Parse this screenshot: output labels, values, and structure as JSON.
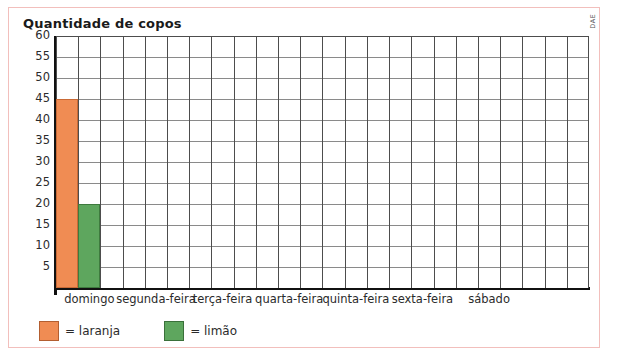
{
  "credit": "DAE",
  "chart_data": {
    "type": "bar",
    "title": "Quantidade de copos",
    "xlabel": "",
    "ylabel": "",
    "ylim": [
      0,
      60
    ],
    "ytick_step": 5,
    "yticks": [
      60,
      55,
      50,
      45,
      40,
      35,
      30,
      25,
      20,
      15,
      10,
      5
    ],
    "grid": true,
    "legend_position": "below-axis-left",
    "categories": [
      "domingo",
      "segunda-feira",
      "terça-feira",
      "quarta-feira",
      "quinta-feira",
      "sexta-feira",
      "sábado"
    ],
    "series": [
      {
        "name": "laranja",
        "legend_label": "= laranja",
        "color": "#f08c53",
        "border_color": "#c96a36",
        "values": [
          45,
          0,
          0,
          0,
          0,
          0,
          0
        ]
      },
      {
        "name": "limão",
        "legend_label": "= limão",
        "color": "#5ea65e",
        "border_color": "#3e7a3e",
        "values": [
          20,
          0,
          0,
          0,
          0,
          0,
          0
        ]
      }
    ],
    "annotations": []
  },
  "colors": {
    "frame": "#f2bfbc",
    "axis": "#111111",
    "grid_vertical": "#4d4d4d",
    "grid_horizontal": "#8a8a8a",
    "text": "#2b2b2b",
    "title": "#1a1a1a"
  }
}
